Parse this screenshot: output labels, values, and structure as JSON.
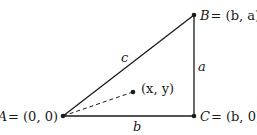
{
  "diagram": {
    "type": "right-triangle",
    "colors": {
      "stroke": "#1a1a1a",
      "background": "#ffffff"
    },
    "points": {
      "A": {
        "label_name": "A",
        "label_coords": "= (0, 0)"
      },
      "B": {
        "label_name": "B",
        "label_coords": "= (b, a)"
      },
      "C": {
        "label_name": "C",
        "label_coords": "= (b, 0)"
      },
      "P": {
        "label": "(x, y)"
      }
    },
    "sides": {
      "hypotenuse": "c",
      "vertical": "a",
      "horizontal": "b"
    }
  }
}
